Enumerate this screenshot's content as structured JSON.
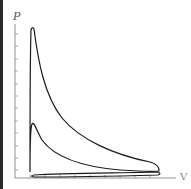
{
  "diagram": {
    "type": "pressure-volume indicator diagram",
    "y_axis_label": "P",
    "x_axis_label": "V",
    "colors": {
      "curve": "#1a1a1a",
      "axis": "#666666",
      "background": "#ffffff",
      "left_strip": "#2a2a2a"
    },
    "y_ticks_count": 14,
    "x_ticks_count": 9,
    "elements": [
      {
        "name": "compression-expansion-loop",
        "description": "power loop with sharp peak near small volume"
      },
      {
        "name": "pumping-loop",
        "description": "thin loop along the bottom near the V axis"
      }
    ]
  }
}
